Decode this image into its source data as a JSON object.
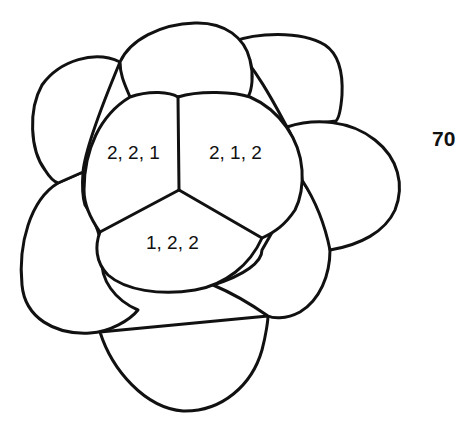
{
  "figure": {
    "number": "70",
    "cells": [
      {
        "id": "upper-left",
        "label": "2, 2, 1"
      },
      {
        "id": "upper-right",
        "label": "2, 1, 2"
      },
      {
        "id": "bottom",
        "label": "1, 2, 2"
      }
    ],
    "colors": {
      "stroke": "#111111",
      "background": "#ffffff"
    }
  }
}
